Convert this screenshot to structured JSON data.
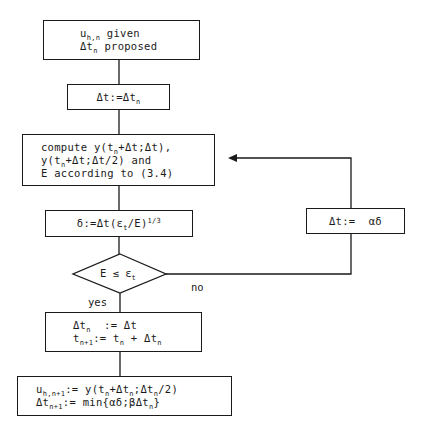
{
  "diagram": {
    "type": "flowchart",
    "title": "",
    "nodes": [
      {
        "id": "start",
        "shape": "rect",
        "lines": [
          "u_{h,n} given",
          "Δt_n proposed"
        ]
      },
      {
        "id": "init_dt",
        "shape": "rect",
        "lines": [
          "Δt:=Δt_n"
        ]
      },
      {
        "id": "compute",
        "shape": "rect",
        "lines": [
          "compute y(t_n+Δt;Δt),",
          "y(t_n+Δt;Δt/2) and",
          "E according to (3.4)"
        ]
      },
      {
        "id": "delta",
        "shape": "rect",
        "lines": [
          "δ:=Δt(ε_t/E)^{1/3}"
        ]
      },
      {
        "id": "decision",
        "shape": "diamond",
        "lines": [
          "E ≤ ε_t"
        ]
      },
      {
        "id": "accept",
        "shape": "rect",
        "lines": [
          "Δt_n := Δt",
          "t_{n+1}:= t_n + Δt_n"
        ]
      },
      {
        "id": "update",
        "shape": "rect",
        "lines": [
          "u_{h,n+1}:= y(t_n+Δt_n;Δt_n/2)",
          "Δt_{n+1}:= min{αδ;βΔt_n}"
        ]
      },
      {
        "id": "retry",
        "shape": "rect",
        "lines": [
          "Δt:= αδ"
        ]
      }
    ],
    "edges": [
      {
        "from": "start",
        "to": "init_dt",
        "label": ""
      },
      {
        "from": "init_dt",
        "to": "compute",
        "label": ""
      },
      {
        "from": "compute",
        "to": "delta",
        "label": ""
      },
      {
        "from": "delta",
        "to": "decision",
        "label": ""
      },
      {
        "from": "decision",
        "to": "accept",
        "label": "yes"
      },
      {
        "from": "decision",
        "to": "retry",
        "label": "no"
      },
      {
        "from": "retry",
        "to": "compute",
        "label": "",
        "arrow": true
      },
      {
        "from": "accept",
        "to": "update",
        "label": ""
      }
    ],
    "labels": {
      "yes": "yes",
      "no": "no"
    },
    "colors": {
      "stroke": "#1a1a1a",
      "background": "#ffffff"
    }
  }
}
